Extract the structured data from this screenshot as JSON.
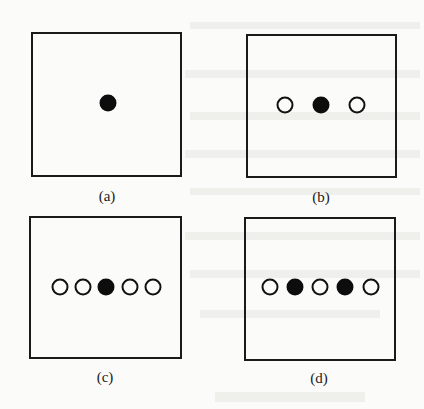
{
  "figure": {
    "panels": [
      {
        "id": "a",
        "caption": "(a)",
        "box": {
          "left": 31,
          "top": 32,
          "width": 151,
          "height": 145
        },
        "caption_pos": {
          "x": 107,
          "y": 188
        },
        "dots": [
          {
            "type": "filled",
            "x": 108,
            "y": 103
          }
        ]
      },
      {
        "id": "b",
        "caption": "(b)",
        "box": {
          "left": 246,
          "top": 34,
          "width": 151,
          "height": 144
        },
        "caption_pos": {
          "x": 321,
          "y": 189
        },
        "dots": [
          {
            "type": "hollow",
            "x": 285,
            "y": 105
          },
          {
            "type": "filled",
            "x": 321,
            "y": 105
          },
          {
            "type": "hollow",
            "x": 357,
            "y": 105
          }
        ]
      },
      {
        "id": "c",
        "caption": "(c)",
        "box": {
          "left": 29,
          "top": 216,
          "width": 153,
          "height": 143
        },
        "caption_pos": {
          "x": 105,
          "y": 369
        },
        "dots": [
          {
            "type": "hollow",
            "x": 60,
            "y": 287
          },
          {
            "type": "hollow",
            "x": 83,
            "y": 287
          },
          {
            "type": "filled",
            "x": 106,
            "y": 287
          },
          {
            "type": "hollow",
            "x": 130,
            "y": 287
          },
          {
            "type": "hollow",
            "x": 153,
            "y": 287
          }
        ]
      },
      {
        "id": "d",
        "caption": "(d)",
        "box": {
          "left": 244,
          "top": 217,
          "width": 152,
          "height": 144
        },
        "caption_pos": {
          "x": 319,
          "y": 370
        },
        "dots": [
          {
            "type": "hollow",
            "x": 270,
            "y": 287
          },
          {
            "type": "filled",
            "x": 295,
            "y": 287
          },
          {
            "type": "hollow",
            "x": 320,
            "y": 287
          },
          {
            "type": "filled",
            "x": 345,
            "y": 287
          },
          {
            "type": "hollow",
            "x": 371,
            "y": 287
          }
        ]
      }
    ]
  },
  "colors": {
    "background": "#fbfbf9",
    "stroke": "#1a1a1a",
    "filled_dot": "#0d0d0d"
  }
}
